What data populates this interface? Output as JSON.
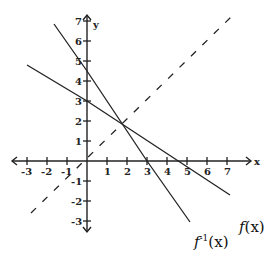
{
  "chart_data": {
    "type": "line",
    "title": "",
    "xlabel": "x",
    "ylabel": "y",
    "xlim": [
      -3,
      7
    ],
    "ylim": [
      -3,
      7
    ],
    "grid": false,
    "x_ticks": [
      "-3",
      "-2",
      "-1",
      "1",
      "2",
      "3",
      "4",
      "5",
      "6",
      "7"
    ],
    "y_ticks": [
      "7",
      "6",
      "5",
      "4",
      "3",
      "2",
      "1",
      "-1",
      "-2",
      "-3"
    ],
    "series": [
      {
        "name": "f(x)",
        "style": "solid",
        "points": [
          [
            -3,
            4.8
          ],
          [
            0,
            3
          ],
          [
            7.15,
            -1.7
          ]
        ]
      },
      {
        "name": "f^-1(x)",
        "style": "solid",
        "points": [
          [
            -1.65,
            6.85
          ],
          [
            0,
            4.5
          ],
          [
            3,
            0
          ],
          [
            5.15,
            -3.05
          ]
        ]
      },
      {
        "name": "y = x",
        "style": "dashed",
        "points": [
          [
            -2.8,
            -2.6
          ],
          [
            7.3,
            7.3
          ]
        ]
      }
    ],
    "annotations": [
      {
        "text": "f(x)",
        "near": [
          7.2,
          -1.9
        ]
      },
      {
        "text": "f^-1(x)",
        "near": [
          5.3,
          -3.9
        ]
      }
    ]
  },
  "labels": {
    "x_axis": "x",
    "y_axis": "y",
    "f": "f",
    "f_arg": "(x)",
    "finv": "f",
    "finv_sup": "-1",
    "finv_arg": "(x)"
  },
  "ticks": {
    "x": [
      {
        "v": -3,
        "t": "-3"
      },
      {
        "v": -2,
        "t": "-2"
      },
      {
        "v": -1,
        "t": "-1"
      },
      {
        "v": 1,
        "t": "1"
      },
      {
        "v": 2,
        "t": "2"
      },
      {
        "v": 3,
        "t": "3"
      },
      {
        "v": 4,
        "t": "4"
      },
      {
        "v": 5,
        "t": "5"
      },
      {
        "v": 6,
        "t": "6"
      },
      {
        "v": 7,
        "t": "7"
      }
    ],
    "y": [
      {
        "v": 7,
        "t": "7"
      },
      {
        "v": 6,
        "t": "6"
      },
      {
        "v": 5,
        "t": "5"
      },
      {
        "v": 4,
        "t": "4"
      },
      {
        "v": 3,
        "t": "3"
      },
      {
        "v": 2,
        "t": "2"
      },
      {
        "v": 1,
        "t": "1"
      },
      {
        "v": -1,
        "t": "-1"
      },
      {
        "v": -2,
        "t": "-2"
      },
      {
        "v": -3,
        "t": "-3"
      }
    ]
  }
}
